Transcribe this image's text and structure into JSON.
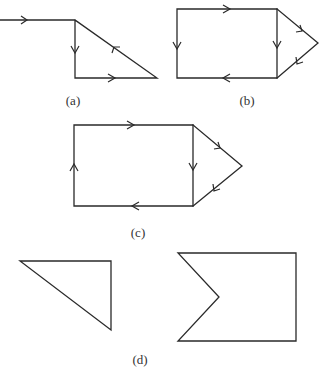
{
  "labels": {
    "a": "(a)",
    "b": "(b)",
    "c": "(c)",
    "d": "(d)"
  },
  "figures": {
    "a": {
      "description": "Incoming horizontal line into a right triangle loop with directed edges",
      "vertices": [
        [
          0,
          20
        ],
        [
          75,
          20
        ],
        [
          75,
          78
        ],
        [
          157,
          78
        ]
      ],
      "arrows": [
        "right on incoming line",
        "down on vertical edge",
        "right on bottom edge",
        "up-left on hypotenuse"
      ]
    },
    "b": {
      "description": "Rectangle with triangular point on right; directed edges",
      "vertices": [
        [
          177,
          9
        ],
        [
          277,
          9
        ],
        [
          318,
          43
        ],
        [
          277,
          78
        ],
        [
          177,
          78
        ]
      ],
      "arrows": [
        "right on top",
        "down on left",
        "down on middle vertical",
        "down-right on upper diagonal",
        "down-left on lower diagonal",
        "left on bottom"
      ]
    },
    "c": {
      "description": "Rectangle with triangular point on right; directed edges",
      "vertices": [
        [
          74,
          125
        ],
        [
          193,
          125
        ],
        [
          242,
          166
        ],
        [
          193,
          206
        ],
        [
          74,
          206
        ]
      ],
      "arrows": [
        "right on top",
        "up on left",
        "down on middle vertical",
        "down-right on upper diagonal",
        "down-left on lower diagonal",
        "left on bottom"
      ]
    },
    "d": {
      "description": "Two undirected shapes: right triangle and rectangle with notch on left",
      "triangle": [
        [
          20,
          261
        ],
        [
          111,
          261
        ],
        [
          111,
          330
        ]
      ],
      "notched_rect": [
        [
          178,
          253
        ],
        [
          296,
          253
        ],
        [
          296,
          341
        ],
        [
          178,
          341
        ],
        [
          219,
          297
        ]
      ]
    }
  }
}
